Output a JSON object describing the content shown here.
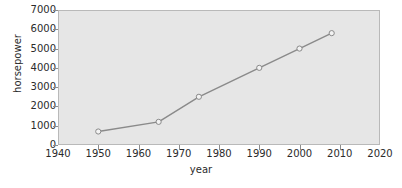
{
  "chart_data": {
    "type": "line",
    "title": "",
    "xlabel": "year",
    "ylabel": "horsepower",
    "xlim": [
      1940,
      2020
    ],
    "ylim": [
      0,
      7000
    ],
    "grid": false,
    "legend": null,
    "xticks": [
      1940,
      1950,
      1960,
      1970,
      1980,
      1990,
      2000,
      2010,
      2020
    ],
    "yticks": [
      0,
      1000,
      2000,
      3000,
      4000,
      5000,
      6000,
      7000
    ],
    "xtick_labels": [
      "1940",
      "1950",
      "1960",
      "1970",
      "1980",
      "1990",
      "2000",
      "2010",
      "2020"
    ],
    "ytick_labels": [
      "0",
      "1000",
      "2000",
      "3000",
      "4000",
      "5000",
      "6000",
      "7000"
    ],
    "series": [
      {
        "name": "horsepower",
        "marker": "open-circle",
        "color": "#8a8a8a",
        "x": [
          1950,
          1965,
          1975,
          1990,
          2000,
          2008
        ],
        "values": [
          700,
          1200,
          2500,
          4000,
          5000,
          5800
        ],
        "points": [
          {
            "x": 1950,
            "y": 700
          },
          {
            "x": 1965,
            "y": 1200
          },
          {
            "x": 1975,
            "y": 2500
          },
          {
            "x": 1990,
            "y": 4000
          },
          {
            "x": 2000,
            "y": 5000
          },
          {
            "x": 2008,
            "y": 5800
          }
        ]
      }
    ]
  },
  "colors": {
    "panel_background": "#e6e6e6",
    "figure_background": "#ffffff",
    "axis": "#b9b9b9",
    "line": "#8a8a8a",
    "marker_fill": "#f2f2f2",
    "text": "#2b2b2b"
  }
}
